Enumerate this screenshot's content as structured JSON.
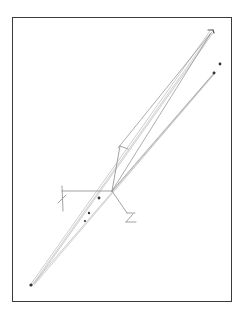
{
  "figure": {
    "type": "line-drawing",
    "frame": {
      "x": 12,
      "y": 17,
      "width": 220,
      "height": 285,
      "border_color": "#3a3a3a"
    },
    "colors": {
      "light_line": "#b9b9b9",
      "mid_line": "#8a8a8a",
      "dark_line": "#555555",
      "marker": "#333333"
    },
    "hub": {
      "x": 112,
      "y": 191
    },
    "long_lines": [
      {
        "x1": 31,
        "y1": 284,
        "x2": 210,
        "y2": 31
      },
      {
        "x1": 33,
        "y1": 284,
        "x2": 212,
        "y2": 32
      },
      {
        "x1": 35,
        "y1": 283,
        "x2": 213,
        "y2": 33
      },
      {
        "x1": 32,
        "y1": 285,
        "x2": 214,
        "y2": 74
      },
      {
        "x1": 34,
        "y1": 285,
        "x2": 216,
        "y2": 72
      },
      {
        "x1": 112,
        "y1": 191,
        "x2": 211,
        "y2": 33
      },
      {
        "x1": 112,
        "y1": 191,
        "x2": 214,
        "y2": 73
      },
      {
        "x1": 118,
        "y1": 148,
        "x2": 210,
        "y2": 34
      }
    ],
    "skeleton_lines": [
      {
        "x1": 112,
        "y1": 191,
        "x2": 62,
        "y2": 191
      },
      {
        "x1": 62,
        "y1": 186,
        "x2": 63,
        "y2": 211
      },
      {
        "x1": 58,
        "y1": 203,
        "x2": 66,
        "y2": 195
      },
      {
        "x1": 112,
        "y1": 191,
        "x2": 120,
        "y2": 146
      },
      {
        "x1": 120,
        "y1": 146,
        "x2": 128,
        "y2": 149
      },
      {
        "x1": 112,
        "y1": 191,
        "x2": 127,
        "y2": 213
      },
      {
        "x1": 127,
        "y1": 213,
        "x2": 135,
        "y2": 213
      },
      {
        "x1": 133,
        "y1": 214,
        "x2": 126,
        "y2": 222
      },
      {
        "x1": 126,
        "y1": 222,
        "x2": 136,
        "y2": 222
      }
    ],
    "markers": [
      {
        "x": 99,
        "y": 198,
        "r": 1.4
      },
      {
        "x": 89,
        "y": 213,
        "r": 1.2
      },
      {
        "x": 85,
        "y": 221,
        "r": 1.1
      },
      {
        "x": 220,
        "y": 64,
        "r": 1.4
      },
      {
        "x": 214,
        "y": 73,
        "r": 1.4
      },
      {
        "x": 31,
        "y": 285,
        "r": 1.6
      }
    ],
    "end_glyphs": [
      {
        "label": "top-right-cap",
        "x1": 208,
        "y1": 30,
        "x2": 213,
        "y2": 30
      },
      {
        "label": "top-right-cap-hook",
        "x1": 213,
        "y1": 30,
        "x2": 214,
        "y2": 33
      }
    ]
  }
}
